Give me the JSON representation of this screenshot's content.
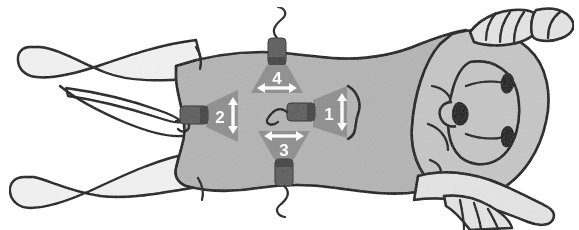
{
  "figure": {
    "view": "dorsal",
    "colors": {
      "body_fill": "#b4b4b4",
      "limb_fill": "#f2f2f2",
      "head_fill": "#c6c6c6",
      "outline": "#000000",
      "fan_fill": "#8e8e8e",
      "probe_body": "#5a5a5a",
      "probe_tip": "#3c3c3c",
      "marker_text": "#ffffff",
      "arrow": "#ffffff",
      "background": "#ffffff"
    }
  },
  "markers": [
    {
      "id": "marker-1",
      "label": "1",
      "arrow_direction": "vertical",
      "fan_orientation": "right",
      "probe_side": "left",
      "has_cable": true,
      "x": 330,
      "y": 112
    },
    {
      "id": "marker-2",
      "label": "2",
      "arrow_direction": "vertical",
      "fan_orientation": "right",
      "probe_side": "left",
      "has_cable": false,
      "x": 222,
      "y": 115
    },
    {
      "id": "marker-3",
      "label": "3",
      "arrow_direction": "horizontal",
      "fan_orientation": "up",
      "probe_side": "bottom",
      "has_cable": true,
      "x": 283,
      "y": 148
    },
    {
      "id": "marker-4",
      "label": "4",
      "arrow_direction": "horizontal",
      "fan_orientation": "down",
      "probe_side": "top",
      "has_cable": true,
      "x": 277,
      "y": 75
    }
  ],
  "anatomy": [
    {
      "id": "hind-leg-upper",
      "label": "hind leg upper"
    },
    {
      "id": "hind-leg-lower",
      "label": "hind leg lower"
    },
    {
      "id": "tail",
      "label": "tail"
    },
    {
      "id": "torso",
      "label": "torso"
    },
    {
      "id": "head",
      "label": "head"
    },
    {
      "id": "snout",
      "label": "snout"
    },
    {
      "id": "ear-left",
      "label": "ear left"
    },
    {
      "id": "ear-right",
      "label": "ear right"
    },
    {
      "id": "foreleg-upper",
      "label": "foreleg upper"
    },
    {
      "id": "foreleg-lower",
      "label": "foreleg lower"
    }
  ]
}
